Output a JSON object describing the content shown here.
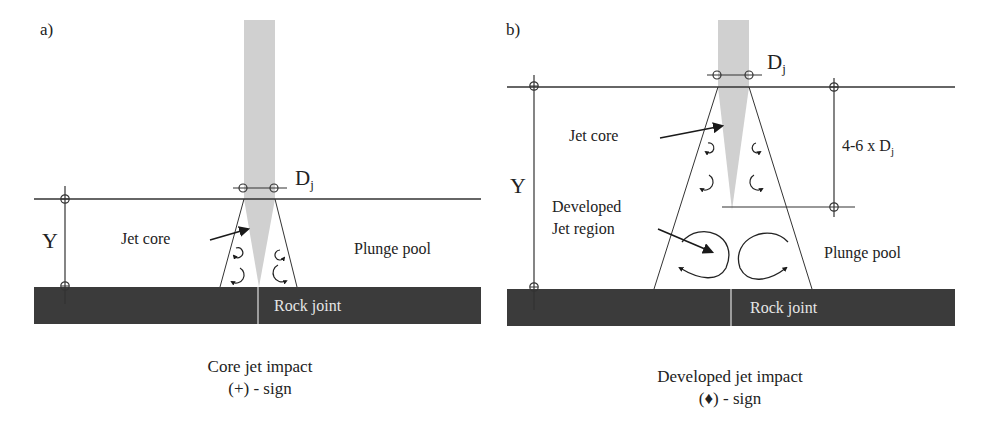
{
  "panels": [
    {
      "tag": "a)",
      "labels": {
        "dj_main": "D",
        "dj_sub": "j",
        "y_label": "Y",
        "jet_core": "Jet core",
        "plunge_pool": "Plunge pool",
        "rock_joint": "Rock joint"
      },
      "caption": {
        "line1": "Core jet impact",
        "line2": "(+) - sign"
      }
    },
    {
      "tag": "b)",
      "labels": {
        "dj_main": "D",
        "dj_sub": "j",
        "y_label": "Y",
        "jet_core": "Jet core",
        "developed_line1": "Developed",
        "developed_line2": "Jet region",
        "core_length_main": "4-6 x D",
        "core_length_sub": "j",
        "plunge_pool": "Plunge pool",
        "rock_joint": "Rock joint"
      },
      "caption": {
        "line1": "Developed jet impact",
        "line2": "(♦) - sign"
      }
    }
  ],
  "colors": {
    "jet": "#cfcfcf",
    "rock": "#3a3a3a",
    "line": "#333333"
  }
}
